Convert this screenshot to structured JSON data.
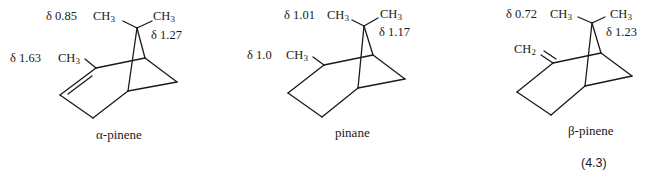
{
  "equation_number": "(4.3)",
  "molecules": [
    {
      "name": "α-pinene",
      "gem_methyl_left": {
        "shift": "δ 0.85",
        "group": "CH",
        "sub": "3"
      },
      "gem_methyl_right": {
        "shift": "δ 1.27",
        "group": "CH",
        "sub": "3"
      },
      "ring_substituent": {
        "shift": "δ 1.63",
        "group": "CH",
        "sub": "3"
      },
      "double_bond": "endocyclic C2=C3"
    },
    {
      "name": "pinane",
      "gem_methyl_left": {
        "shift": "δ 1.01",
        "group": "CH",
        "sub": "3"
      },
      "gem_methyl_right": {
        "shift": "δ 1.17",
        "group": "CH",
        "sub": "3"
      },
      "ring_substituent": {
        "shift": "δ 1.0",
        "group": "CH",
        "sub": "3"
      },
      "double_bond": "none"
    },
    {
      "name": "β-pinene",
      "gem_methyl_left": {
        "shift": "δ 0.72",
        "group": "CH",
        "sub": "3"
      },
      "gem_methyl_right": {
        "shift": "δ 1.23",
        "group": "CH",
        "sub": "3"
      },
      "ring_substituent": {
        "shift": "",
        "group": "CH",
        "sub": "2"
      },
      "double_bond": "exocyclic C2=CH2"
    }
  ]
}
